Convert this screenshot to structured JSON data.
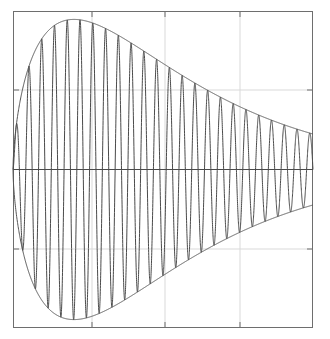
{
  "figure": {
    "title": "",
    "background_color": "#ffffff",
    "width": 330,
    "height": 339
  },
  "axes": {
    "frame_color": "#6e6e6e",
    "frame_width": 1,
    "grid_color": "#d9d9d9",
    "grid_on": true,
    "zero_line_color": "#4a4a4a",
    "tick_color": "#6e6e6e",
    "tick_length": 6,
    "plot_box_px": {
      "left": 13,
      "top": 11,
      "right": 313,
      "bottom": 328
    },
    "x_tick_positions_px": [
      92,
      165,
      240
    ],
    "y_tick_positions_px": [
      90,
      249
    ],
    "x_tick_labels": [
      "",
      "",
      ""
    ],
    "y_tick_labels": [
      "",
      ""
    ],
    "xlabel": "",
    "ylabel": ""
  },
  "chart_data": {
    "type": "line",
    "title": "",
    "subtitle": "",
    "xlabel": "",
    "ylabel": "",
    "grid": true,
    "legend": [],
    "legend_position": "none",
    "xlim": [
      0,
      1
    ],
    "ylim": [
      -1.08,
      1.08
    ],
    "series": [
      {
        "name": "signal",
        "color": "#4a4a4a",
        "line_width": 1,
        "carrier_cycles": 23.5,
        "carrier_phase": 0,
        "envelope": {
          "form": "lognormal-like",
          "peak_x": 0.263,
          "peak_y": 1.0,
          "rise_exponent": 0.62,
          "decay_rate": 3.05,
          "zero_at_x": 0.0,
          "end_y": 0.105
        }
      },
      {
        "name": "upper-envelope",
        "color": "#555555",
        "line_width": 1
      },
      {
        "name": "lower-envelope",
        "color": "#555555",
        "line_width": 1
      },
      {
        "name": "zero-axis",
        "color": "#4a4a4a",
        "line_width": 1,
        "y_value": 0
      }
    ],
    "sampled_envelope": {
      "x": [
        0.0,
        0.03,
        0.06,
        0.09,
        0.12,
        0.15,
        0.18,
        0.21,
        0.24,
        0.26,
        0.29,
        0.32,
        0.36,
        0.4,
        0.45,
        0.5,
        0.55,
        0.6,
        0.65,
        0.7,
        0.75,
        0.8,
        0.85,
        0.9,
        0.95,
        1.0
      ],
      "upper": [
        0.0,
        0.3,
        0.52,
        0.69,
        0.83,
        0.92,
        0.97,
        1.0,
        1.0,
        1.0,
        0.98,
        0.95,
        0.9,
        0.83,
        0.73,
        0.63,
        0.54,
        0.46,
        0.39,
        0.33,
        0.28,
        0.23,
        0.19,
        0.16,
        0.13,
        0.105
      ],
      "lower": [
        0.0,
        -0.3,
        -0.52,
        -0.69,
        -0.83,
        -0.92,
        -0.97,
        -1.0,
        -1.0,
        -1.0,
        -0.98,
        -0.95,
        -0.9,
        -0.83,
        -0.73,
        -0.63,
        -0.54,
        -0.46,
        -0.39,
        -0.33,
        -0.28,
        -0.23,
        -0.19,
        -0.16,
        -0.13,
        -0.105
      ]
    }
  }
}
